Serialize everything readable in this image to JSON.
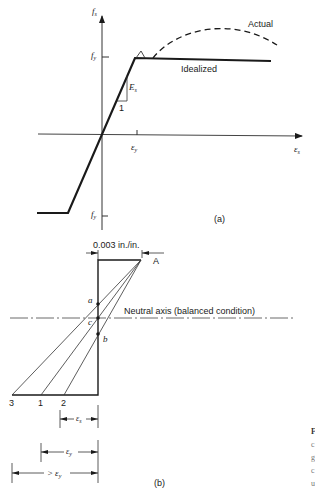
{
  "figure_a": {
    "y_axis_label": "f",
    "y_axis_sub": "s",
    "x_axis_label": "ε",
    "x_axis_sub": "s",
    "fy_top_label": "f",
    "fy_top_sub": "y",
    "fy_bottom_label": "f",
    "fy_bottom_sub": "y",
    "ey_label": "ε",
    "ey_sub": "y",
    "modulus_label": "E",
    "modulus_sub": "s",
    "slope_run_label": "1",
    "actual_label": "Actual",
    "idealized_label": "Idealized",
    "panel_label": "(a)"
  },
  "figure_b": {
    "strain_label": "0.003 in./in.",
    "point_A_label": "A",
    "point_a_label": "a",
    "point_b_label": "b",
    "point_c_label": "c",
    "neutral_axis_label": "Neutral axis (balanced condition)",
    "bottom_labels": [
      "3",
      "1",
      "2"
    ],
    "dim_es_label": "ε",
    "dim_es_sub": "s",
    "dim_ey_label": "ε",
    "dim_ey_sub": "y",
    "dim_gt_ey_prefix": ">",
    "dim_gt_ey_label": "ε",
    "dim_gt_ey_sub": "y",
    "panel_label": "(b)"
  },
  "caption_fragment": {
    "lines": [
      "F",
      "c",
      "g",
      "c",
      "u"
    ]
  },
  "colors": {
    "ink": "#1a1a1a",
    "axis": "#333333",
    "background": "#ffffff"
  }
}
